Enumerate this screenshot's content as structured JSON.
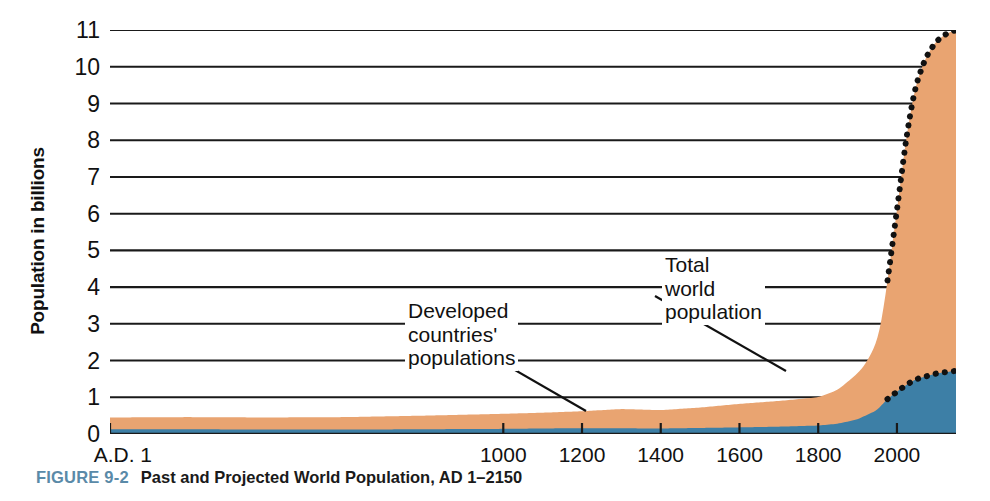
{
  "figure": {
    "number_label": "FIGURE 9-2",
    "caption": "Past and Projected World Population, AD 1–2150",
    "figno_color": "#5a8aa8"
  },
  "chart_data": {
    "type": "area",
    "title": "Past and Projected World Population, AD 1–2150",
    "xlabel": "",
    "ylabel": "Population in billions",
    "xlim": [
      1,
      2150
    ],
    "ylim": [
      0,
      11
    ],
    "grid": true,
    "legend_position": "inline-annotations",
    "y_ticks": [
      0,
      1,
      2,
      3,
      4,
      5,
      6,
      7,
      8,
      9,
      10,
      11
    ],
    "y_tick_labels": [
      "0",
      "1",
      "2",
      "3",
      "4",
      "5",
      "6",
      "7",
      "8",
      "9",
      "10",
      "11"
    ],
    "x_ticks": [
      1,
      1000,
      1200,
      1400,
      1600,
      1800,
      2000
    ],
    "x_tick_labels": [
      "A.D. 1",
      "1000",
      "1200",
      "1400",
      "1600",
      "1800",
      "2000"
    ],
    "colors": {
      "total_world_population": "#e9a471",
      "developed_countries": "#3d7fa6",
      "projection_line": "#111111",
      "gridline": "#1a1a1a"
    },
    "projection_starts_year": 1975,
    "series": [
      {
        "name": "Total world population",
        "stacked": true,
        "fill_color": "#e9a471",
        "x": [
          1,
          200,
          400,
          600,
          800,
          1000,
          1100,
          1200,
          1300,
          1400,
          1500,
          1600,
          1700,
          1750,
          1800,
          1850,
          1900,
          1920,
          1940,
          1950,
          1960,
          1970,
          1975,
          1980,
          1990,
          2000,
          2010,
          2020,
          2030,
          2040,
          2050,
          2075,
          2100,
          2125,
          2150
        ],
        "values": [
          0.45,
          0.46,
          0.45,
          0.46,
          0.5,
          0.55,
          0.58,
          0.62,
          0.68,
          0.65,
          0.72,
          0.82,
          0.9,
          0.95,
          1.0,
          1.2,
          1.65,
          1.9,
          2.3,
          2.55,
          3.0,
          3.7,
          4.1,
          4.45,
          5.3,
          6.1,
          6.9,
          7.8,
          8.5,
          9.1,
          9.6,
          10.3,
          10.7,
          10.9,
          11.0
        ]
      },
      {
        "name": "Developed countries' populations",
        "stacked": true,
        "fill_color": "#3d7fa6",
        "x": [
          1,
          200,
          400,
          600,
          800,
          1000,
          1200,
          1400,
          1600,
          1700,
          1800,
          1850,
          1900,
          1950,
          1975,
          2000,
          2025,
          2050,
          2100,
          2150
        ],
        "values": [
          0.13,
          0.13,
          0.12,
          0.12,
          0.13,
          0.14,
          0.16,
          0.15,
          0.18,
          0.2,
          0.23,
          0.28,
          0.4,
          0.65,
          0.95,
          1.15,
          1.35,
          1.5,
          1.65,
          1.72
        ]
      }
    ],
    "annotations": [
      {
        "id": "developed",
        "text": "Developed\ncountries'\npopulations",
        "points_to": "developed-countries-band"
      },
      {
        "id": "total",
        "text": "Total\nworld\npopulation",
        "points_to": "total-world-population-band"
      }
    ]
  }
}
